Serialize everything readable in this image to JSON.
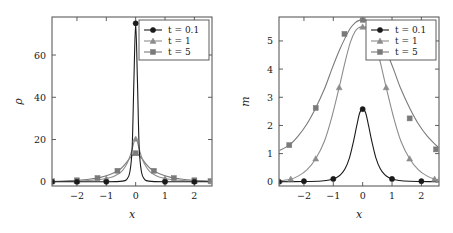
{
  "figure": {
    "panels": [
      "density-panel",
      "magnetization-panel"
    ],
    "background": "#ffffff"
  },
  "colors": {
    "series_t01": "#1a1a1a",
    "series_t1": "#8c8c8c",
    "series_t5": "#7a7a7a",
    "frame": "#4d4d4d",
    "text": "#1a1a1a"
  },
  "legend": {
    "entries": [
      {
        "label": "t = 0.1",
        "marker": "circle-marker-icon",
        "color": "#1a1a1a"
      },
      {
        "label": "t = 1",
        "marker": "triangle-marker-icon",
        "color": "#8c8c8c"
      },
      {
        "label": "t = 5",
        "marker": "square-marker-icon",
        "color": "#7a7a7a"
      }
    ]
  },
  "chart_data": [
    {
      "type": "line",
      "id": "density-panel",
      "title": "",
      "xlabel": "x",
      "ylabel": "ρ",
      "xlim": [
        -2.85,
        2.6
      ],
      "ylim": [
        -2.0,
        78.0
      ],
      "xticks": [
        -2,
        -1,
        0,
        1,
        2
      ],
      "xtick_labels": [
        "−2",
        "−1",
        "0",
        "1",
        "2"
      ],
      "yticks": [
        0,
        20,
        40,
        60
      ],
      "ytick_labels": [
        "0",
        "20",
        "40",
        "60"
      ],
      "grid": false,
      "legend_position": "top-right",
      "series": [
        {
          "name": "t = 0.1",
          "marker": "circle",
          "color": "#1a1a1a",
          "x": [
            -2.85,
            -2.0,
            -1.0,
            -0.45,
            -0.3,
            -0.2,
            -0.12,
            -0.06,
            0.0,
            0.06,
            0.12,
            0.2,
            0.3,
            0.45,
            1.0,
            2.0,
            2.6
          ],
          "y": [
            0.0,
            0.0,
            0.0,
            0.3,
            1.2,
            4.5,
            16.0,
            48.0,
            75.0,
            48.0,
            16.0,
            4.5,
            1.2,
            0.3,
            0.0,
            0.0,
            0.0
          ],
          "marker_x": [
            -2.85,
            -2.0,
            -1.0,
            0.0,
            1.0,
            2.0
          ],
          "marker_y": [
            0.0,
            0.0,
            0.0,
            75.0,
            0.0,
            0.0
          ]
        },
        {
          "name": "t = 1",
          "marker": "triangle",
          "color": "#8c8c8c",
          "x": [
            -2.85,
            -2.4,
            -2.0,
            -1.6,
            -1.2,
            -0.9,
            -0.7,
            -0.5,
            -0.35,
            -0.22,
            -0.12,
            -0.05,
            0.0,
            0.05,
            0.12,
            0.22,
            0.35,
            0.5,
            0.7,
            0.9,
            1.2,
            1.6,
            2.0,
            2.4,
            2.6
          ],
          "y": [
            0.12,
            0.2,
            0.35,
            0.6,
            1.1,
            1.9,
            2.9,
            4.6,
            7.2,
            11.0,
            15.5,
            19.2,
            20.3,
            19.2,
            15.5,
            11.0,
            7.2,
            4.6,
            2.9,
            1.9,
            1.1,
            0.6,
            0.35,
            0.2,
            0.12
          ],
          "marker_x": [
            -2.85,
            -2.0,
            -1.0,
            0.0,
            1.0,
            2.0,
            2.6
          ],
          "marker_y": [
            0.12,
            0.35,
            1.5,
            20.3,
            1.5,
            0.35,
            0.12
          ]
        },
        {
          "name": "t = 5",
          "marker": "square",
          "color": "#7a7a7a",
          "x": [
            -2.85,
            -2.4,
            -2.0,
            -1.6,
            -1.2,
            -0.9,
            -0.7,
            -0.5,
            -0.35,
            -0.22,
            -0.12,
            -0.05,
            0.0,
            0.05,
            0.12,
            0.22,
            0.35,
            0.5,
            0.7,
            0.9,
            1.2,
            1.6,
            2.0,
            2.4,
            2.6
          ],
          "y": [
            0.25,
            0.4,
            0.7,
            1.2,
            2.1,
            3.3,
            4.5,
            6.3,
            8.5,
            10.8,
            12.4,
            13.3,
            13.5,
            13.3,
            12.4,
            10.8,
            8.5,
            6.3,
            4.5,
            3.3,
            2.1,
            1.2,
            0.7,
            0.4,
            0.25
          ],
          "marker_x": [
            -2.85,
            -2.0,
            -1.3,
            -0.62,
            0.0,
            0.62,
            1.3,
            2.0,
            2.55
          ],
          "marker_y": [
            0.25,
            0.7,
            1.75,
            5.2,
            13.5,
            5.2,
            1.75,
            0.7,
            0.3
          ]
        }
      ]
    },
    {
      "type": "line",
      "id": "magnetization-panel",
      "title": "",
      "xlabel": "x",
      "ylabel": "m",
      "xlim": [
        -2.85,
        2.6
      ],
      "ylim": [
        -0.15,
        5.85
      ],
      "xticks": [
        -2,
        -1,
        0,
        1,
        2
      ],
      "xtick_labels": [
        "−2",
        "−1",
        "0",
        "1",
        "2"
      ],
      "yticks": [
        0,
        1,
        2,
        3,
        4,
        5
      ],
      "ytick_labels": [
        "0",
        "1",
        "2",
        "3",
        "4",
        "5"
      ],
      "grid": false,
      "legend_position": "top-right",
      "series": [
        {
          "name": "t = 0.1",
          "marker": "circle",
          "color": "#1a1a1a",
          "x": [
            -2.85,
            -2.0,
            -1.4,
            -1.1,
            -0.9,
            -0.75,
            -0.6,
            -0.45,
            -0.32,
            -0.2,
            -0.1,
            0.0,
            0.1,
            0.2,
            0.32,
            0.45,
            0.6,
            0.75,
            0.9,
            1.1,
            1.4,
            2.0,
            2.6
          ],
          "y": [
            0.0,
            0.01,
            0.03,
            0.07,
            0.14,
            0.25,
            0.46,
            0.85,
            1.4,
            2.0,
            2.45,
            2.58,
            2.45,
            2.0,
            1.4,
            0.85,
            0.46,
            0.25,
            0.14,
            0.07,
            0.03,
            0.01,
            0.0
          ],
          "marker_x": [
            -2.85,
            -2.0,
            -1.0,
            0.0,
            1.0,
            2.0
          ],
          "marker_y": [
            0.0,
            0.02,
            0.1,
            2.58,
            0.1,
            0.02
          ]
        },
        {
          "name": "t = 1",
          "marker": "triangle",
          "color": "#8c8c8c",
          "x": [
            -2.85,
            -2.5,
            -2.2,
            -1.9,
            -1.6,
            -1.3,
            -1.05,
            -0.8,
            -0.6,
            -0.42,
            -0.25,
            -0.12,
            0.0,
            0.12,
            0.25,
            0.42,
            0.6,
            0.8,
            1.05,
            1.3,
            1.6,
            1.9,
            2.2,
            2.5,
            2.6
          ],
          "y": [
            0.03,
            0.08,
            0.2,
            0.42,
            0.82,
            1.45,
            2.3,
            3.35,
            4.25,
            4.95,
            5.35,
            5.48,
            5.5,
            5.48,
            5.35,
            4.95,
            4.25,
            3.35,
            2.3,
            1.45,
            0.82,
            0.42,
            0.2,
            0.08,
            0.06
          ],
          "marker_x": [
            -2.85,
            -2.45,
            -1.6,
            -0.8,
            0.0,
            0.8,
            1.6,
            2.45,
            2.6
          ],
          "marker_y": [
            0.03,
            0.1,
            0.82,
            3.35,
            5.5,
            3.35,
            0.82,
            0.1,
            0.06
          ]
        },
        {
          "name": "t = 5",
          "marker": "square",
          "color": "#7a7a7a",
          "x": [
            -2.85,
            -2.5,
            -2.2,
            -1.9,
            -1.6,
            -1.3,
            -1.05,
            -0.8,
            -0.6,
            -0.42,
            -0.25,
            -0.12,
            0.0,
            0.12,
            0.25,
            0.42,
            0.6,
            0.8,
            1.05,
            1.3,
            1.6,
            1.9,
            2.2,
            2.5,
            2.6
          ],
          "y": [
            1.1,
            1.3,
            1.62,
            2.05,
            2.62,
            3.3,
            4.0,
            4.65,
            5.1,
            5.45,
            5.65,
            5.73,
            5.75,
            5.73,
            5.65,
            5.45,
            5.1,
            4.65,
            4.0,
            3.3,
            2.62,
            2.05,
            1.62,
            1.3,
            1.2
          ],
          "marker_x": [
            -2.5,
            -1.6,
            -0.62,
            0.0,
            0.62,
            1.6,
            2.5
          ],
          "marker_y": [
            1.3,
            2.62,
            5.25,
            5.75,
            4.78,
            2.25,
            1.15
          ]
        }
      ]
    }
  ]
}
